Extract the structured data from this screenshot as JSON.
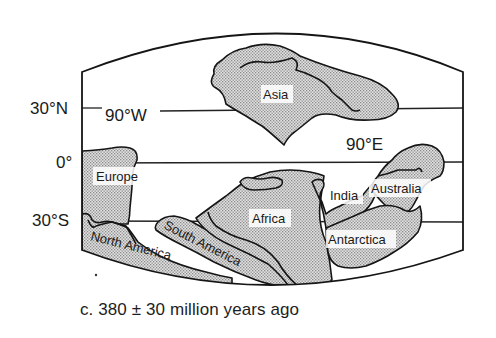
{
  "figure": {
    "caption": "c. 380 ± 30 million years ago",
    "fill_color": "#c9c9c9",
    "line_color": "#151515"
  },
  "latitudes": {
    "n30": "30°N",
    "eq": "0°",
    "s30": "30°S"
  },
  "longitudes": {
    "w90": "90°W",
    "e90": "90°E"
  },
  "continents": {
    "asia": "Asia",
    "europe": "Europe",
    "africa": "Africa",
    "india": "India",
    "australia": "Australia",
    "antarctica": "Antarctica",
    "north_america": "North America",
    "south_america": "South America"
  }
}
